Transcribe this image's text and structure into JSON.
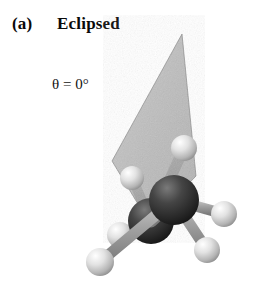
{
  "figure": {
    "panel_label": "(a)",
    "title": "Eclipsed",
    "dihedral_label": "θ = 0°",
    "dihedral_symbol": "θ",
    "dihedral_value": "0°",
    "background_color": "#ffffff",
    "width": 266,
    "height": 296
  },
  "molecule": {
    "name": "ethane-eclipsed-conformation",
    "formula": "C2H6",
    "carbon_color": "#2b2b2b",
    "carbon_highlight_color": "#6e6e6e",
    "hydrogen_color": "#d9d9d9",
    "hydrogen_highlight_color": "#f4f4f4",
    "bond_color": "#9a9a9a",
    "plane_color": "#a8a8a8",
    "plane_edge_color": "#7d7d7d",
    "plane_opacity": "0.72",
    "atoms": [
      {
        "id": "C-front",
        "element": "C",
        "cx": 174,
        "cy": 200,
        "r": 25
      },
      {
        "id": "C-back",
        "element": "C",
        "cx": 151,
        "cy": 221,
        "r": 23
      },
      {
        "id": "H-back-top",
        "element": "H",
        "cx": 184,
        "cy": 148,
        "r": 13
      },
      {
        "id": "H-back-left",
        "element": "H",
        "cx": 132,
        "cy": 178,
        "r": 12
      },
      {
        "id": "H-back-lower",
        "element": "H",
        "cx": 120,
        "cy": 235,
        "r": 13
      },
      {
        "id": "H-front-right",
        "element": "H",
        "cx": 224,
        "cy": 214,
        "r": 13
      },
      {
        "id": "H-front-lower-right",
        "element": "H",
        "cx": 207,
        "cy": 250,
        "r": 13
      },
      {
        "id": "H-front-lower-left",
        "element": "H",
        "cx": 100,
        "cy": 262,
        "r": 14
      }
    ],
    "bonds": [
      {
        "id": "bond-C-C",
        "from": "C-front",
        "to": "C-back"
      },
      {
        "id": "bond-C-back-H-top",
        "from": "C-back",
        "to": "H-back-top"
      },
      {
        "id": "bond-C-back-H-left",
        "from": "C-back",
        "to": "H-back-left"
      },
      {
        "id": "bond-C-back-H-lower",
        "from": "C-back",
        "to": "H-back-lower"
      },
      {
        "id": "bond-C-front-H-right",
        "from": "C-front",
        "to": "H-front-right"
      },
      {
        "id": "bond-C-front-H-lower-right",
        "from": "C-front",
        "to": "H-front-lower-right"
      },
      {
        "id": "bond-C-front-H-lower-left",
        "from": "C-front",
        "to": "H-front-lower-left"
      }
    ],
    "dihedral_plane": {
      "id": "dihedral-plane",
      "shape": "kite",
      "points": "182,34 196,176 150,224 112,161"
    }
  }
}
